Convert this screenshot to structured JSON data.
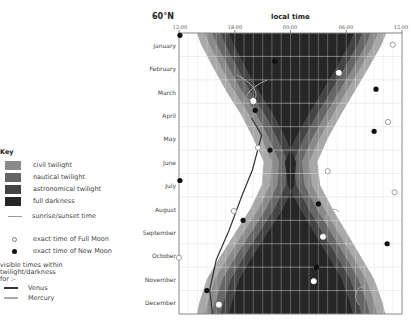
{
  "chart_data": {
    "type": "heatmap",
    "title": "60°N",
    "xlabel": "local time",
    "ylabel": "",
    "x_ticks": [
      "12:00",
      "18:00",
      "00:00",
      "06:00",
      "12:00"
    ],
    "categories": [
      "January",
      "February",
      "March",
      "April",
      "May",
      "June",
      "July",
      "August",
      "September",
      "October",
      "November",
      "December"
    ],
    "legend": [
      {
        "label": "civil twilight",
        "color": "#8a8a8a"
      },
      {
        "label": "nautical twilight",
        "color": "#666666"
      },
      {
        "label": "astronomical twilight",
        "color": "#444444"
      },
      {
        "label": "full darkness",
        "color": "#262626"
      },
      {
        "label": "sunrise/sunset time",
        "color": "#999999"
      }
    ],
    "darkness_bounds_hours_from_noon": {
      "sunset": [
        3.3,
        4.6,
        6.0,
        7.6,
        8.9,
        10.0,
        9.8,
        8.6,
        7.0,
        5.4,
        3.9,
        3.1
      ],
      "sunrise": [
        20.9,
        19.5,
        18.0,
        16.5,
        15.1,
        14.0,
        14.3,
        15.6,
        17.1,
        18.6,
        20.1,
        21.0
      ]
    },
    "full_moon": [
      {
        "month": "January",
        "x_hours": 23.0,
        "y_frac": 0.5
      },
      {
        "month": "February",
        "x_hours": 17.2,
        "y_frac": 0.7
      },
      {
        "month": "March",
        "x_hours": 8.0,
        "y_frac": 0.9
      },
      {
        "month": "April",
        "x_hours": 22.5,
        "y_frac": 0.8
      },
      {
        "month": "May",
        "x_hours": 8.5,
        "y_frac": 0.9
      },
      {
        "month": "June",
        "x_hours": 16.0,
        "y_frac": 0.9
      },
      {
        "month": "July",
        "x_hours": 23.2,
        "y_frac": 0.8
      },
      {
        "month": "August",
        "x_hours": 5.9,
        "y_frac": 0.6
      },
      {
        "month": "September",
        "x_hours": 15.5,
        "y_frac": 0.7
      },
      {
        "month": "October",
        "x_hours": 0.0,
        "y_frac": 0.6
      },
      {
        "month": "November",
        "x_hours": 14.5,
        "y_frac": 0.6
      },
      {
        "month": "December",
        "x_hours": 4.3,
        "y_frac": 0.6
      }
    ],
    "new_moon": [
      {
        "month": "January",
        "x_hours": 0.1,
        "y_frac": 0.1
      },
      {
        "month": "February",
        "x_hours": 10.3,
        "y_frac": 0.2
      },
      {
        "month": "March",
        "x_hours": 21.2,
        "y_frac": 0.4
      },
      {
        "month": "April",
        "x_hours": 8.2,
        "y_frac": 0.3
      },
      {
        "month": "May",
        "x_hours": 21.0,
        "y_frac": 0.2
      },
      {
        "month": "June",
        "x_hours": 9.8,
        "y_frac": 0.0
      },
      {
        "month": "July",
        "x_hours": 0.1,
        "y_frac": 0.3
      },
      {
        "month": "August",
        "x_hours": 15.0,
        "y_frac": 0.3
      },
      {
        "month": "September",
        "x_hours": 6.9,
        "y_frac": 0.0
      },
      {
        "month": "October",
        "x_hours": 22.4,
        "y_frac": 0.0
      },
      {
        "month": "November",
        "x_hours": 14.8,
        "y_frac": 0.0
      },
      {
        "month": "December",
        "x_hours": 3.0,
        "y_frac": 0.0
      }
    ]
  },
  "header": {
    "latitude": "60°N",
    "x_axis_title": "local time",
    "ticks": [
      "12:00",
      "18:00",
      "00:00",
      "06:00",
      "12:00"
    ]
  },
  "months": [
    "January",
    "February",
    "March",
    "April",
    "May",
    "June",
    "July",
    "August",
    "September",
    "October",
    "November",
    "December"
  ],
  "key": {
    "title": "Key",
    "civil": "civil twilight",
    "nautical": "nautical twilight",
    "astronomical": "astronomical twilight",
    "darkness": "full darkness",
    "sunrise": "sunrise/sunset time",
    "full_moon": "exact time of Full Moon",
    "new_moon": "exact time of New Moon",
    "visible_line1": "visible times within",
    "visible_line2": "twilight/darkness",
    "visible_line3": "for :-",
    "venus": "Venus",
    "mercury": "Mercury"
  },
  "colors": {
    "civil": "#8a8a8a",
    "nautical": "#666666",
    "astronomical": "#444444",
    "darkness": "#262626",
    "grid": "#d8d8d8",
    "venus": "#333333",
    "mercury": "#aaaaaa"
  }
}
